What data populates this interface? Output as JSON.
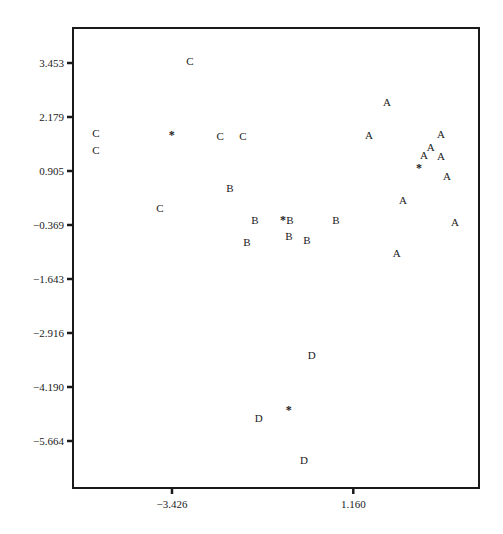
{
  "chart_data": {
    "type": "scatter",
    "title": "",
    "xlabel": "",
    "ylabel": "",
    "xlim": [
      -5.93,
      4.34
    ],
    "ylim": [
      -6.15,
      4.24
    ],
    "grid": false,
    "legend": "none",
    "x_ticks": [
      {
        "value": -3.426,
        "label": "−3.426"
      },
      {
        "value": 1.16,
        "label": "1.160"
      }
    ],
    "y_ticks": [
      {
        "value": 3.453,
        "label": "3.453"
      },
      {
        "value": 2.179,
        "label": "2.179"
      },
      {
        "value": 0.905,
        "label": "0.905"
      },
      {
        "value": -0.369,
        "label": "−0.369"
      },
      {
        "value": -1.643,
        "label": "−1.643"
      },
      {
        "value": -2.916,
        "label": "−2.916"
      },
      {
        "value": -4.19,
        "label": "−4.190"
      },
      {
        "value": -5.664,
        "label": "−5.664"
      }
    ],
    "series": [
      {
        "name": "A",
        "marker": "A",
        "points": [
          [
            2.01,
            2.57
          ],
          [
            1.56,
            1.83
          ],
          [
            3.38,
            1.85
          ],
          [
            3.12,
            1.56
          ],
          [
            2.95,
            1.37
          ],
          [
            3.38,
            1.35
          ],
          [
            3.53,
            0.9
          ],
          [
            2.42,
            0.36
          ],
          [
            3.73,
            -0.14
          ],
          [
            2.26,
            -0.84
          ]
        ],
        "centroid": [
          2.82,
          1.13
        ]
      },
      {
        "name": "B",
        "marker": "B",
        "points": [
          [
            -1.96,
            0.63
          ],
          [
            -1.33,
            -0.09
          ],
          [
            -1.53,
            -0.59
          ],
          [
            -0.44,
            -0.09
          ],
          [
            -0.47,
            -0.46
          ],
          [
            -0.01,
            -0.55
          ],
          [
            0.72,
            -0.09
          ]
        ],
        "centroid": [
          -0.62,
          -0.05
        ]
      },
      {
        "name": "C",
        "marker": "C",
        "points": [
          [
            -5.35,
            1.87
          ],
          [
            -5.35,
            1.49
          ],
          [
            -2.97,
            3.5
          ],
          [
            -2.21,
            1.8
          ],
          [
            -1.63,
            1.8
          ],
          [
            -3.73,
            0.18
          ]
        ],
        "centroid": [
          -3.43,
          1.87
        ]
      },
      {
        "name": "D",
        "marker": "D",
        "points": [
          [
            0.11,
            -3.14
          ],
          [
            -1.23,
            -4.56
          ],
          [
            -0.09,
            -5.52
          ]
        ],
        "centroid": [
          -0.47,
          -4.34
        ]
      }
    ],
    "centroid_marker": "*"
  }
}
